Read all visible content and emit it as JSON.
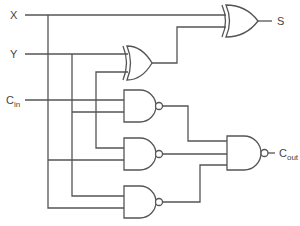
{
  "diagram": {
    "type": "logic-circuit",
    "inputs": [
      {
        "id": "x",
        "label": "X"
      },
      {
        "id": "y",
        "label": "Y"
      },
      {
        "id": "cin",
        "label": "C",
        "subscript": "in"
      }
    ],
    "outputs": [
      {
        "id": "s",
        "label": "S"
      },
      {
        "id": "cout",
        "label": "C",
        "subscript": "out"
      }
    ],
    "gates": [
      {
        "id": "xor1",
        "type": "XOR",
        "inputs": [
          "Y",
          "Cin"
        ]
      },
      {
        "id": "xor2",
        "type": "XOR",
        "inputs": [
          "X",
          "xor1"
        ],
        "output": "S"
      },
      {
        "id": "nand1",
        "type": "NAND",
        "inputs": [
          "Cin",
          "xor-branch"
        ]
      },
      {
        "id": "nand2",
        "type": "NAND",
        "inputs": [
          "Y",
          "X"
        ]
      },
      {
        "id": "nand3",
        "type": "NAND",
        "inputs": [
          "Y",
          "X"
        ]
      },
      {
        "id": "nand4",
        "type": "NAND",
        "inputs": [
          "nand1",
          "nand2",
          "nand3"
        ],
        "output": "Cout"
      }
    ],
    "colors": {
      "wire": "#555555",
      "background": "#ffffff"
    }
  }
}
